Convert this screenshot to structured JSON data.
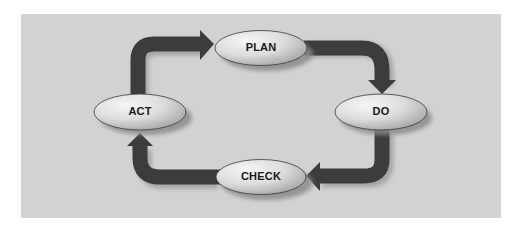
{
  "diagram": {
    "type": "cycle",
    "colors": {
      "background": "#ffffff",
      "panel": "#d2d2d2",
      "arrow": "#3c3c3c",
      "arrow_shadow": "#8f8f8f",
      "node_fill_light": "#f4f4f4",
      "node_fill_dark": "#b8b8b8",
      "node_border": "#3a3a3a",
      "label": "#1a1a1a"
    },
    "nodes": [
      {
        "id": "plan",
        "label": "PLAN"
      },
      {
        "id": "do",
        "label": "DO"
      },
      {
        "id": "check",
        "label": "CHECK"
      },
      {
        "id": "act",
        "label": "ACT"
      }
    ],
    "edges": [
      {
        "from": "PLAN",
        "to": "DO"
      },
      {
        "from": "DO",
        "to": "CHECK"
      },
      {
        "from": "CHECK",
        "to": "ACT"
      },
      {
        "from": "ACT",
        "to": "PLAN"
      }
    ]
  }
}
